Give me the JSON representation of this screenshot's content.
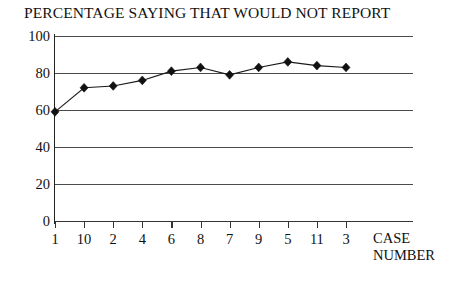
{
  "chart_data": {
    "type": "line",
    "title": "PERCENTAGE SAYING THAT WOULD NOT REPORT",
    "xlabel": "CASE NUMBER",
    "ylabel": "",
    "categories": [
      "1",
      "10",
      "2",
      "4",
      "6",
      "8",
      "7",
      "9",
      "5",
      "11",
      "3"
    ],
    "values": [
      59,
      72,
      73,
      76,
      81,
      83,
      79,
      83,
      86,
      84,
      83
    ],
    "ylim": [
      0,
      100
    ],
    "yticks": [
      0,
      20,
      40,
      60,
      80,
      100
    ],
    "ytick_labels": [
      "0",
      "20",
      "40",
      "60",
      "80",
      "100"
    ],
    "grid": true,
    "grid_axis": "y",
    "legend": "none",
    "marker": "diamond",
    "line_color": "#1a1a1a",
    "grid_color": "#4a4a4a",
    "background_color": "#ffffff"
  },
  "axis_caption": {
    "line1": "CASE",
    "line2": "NUMBER"
  }
}
